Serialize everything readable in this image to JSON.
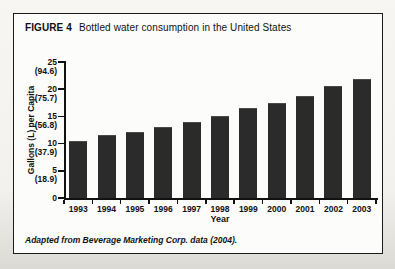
{
  "figure": {
    "label": "FIGURE 4",
    "title": "Bottled water consumption in the United States",
    "footnote": "Adapted from Beverage Marketing Corp. data (2004)."
  },
  "chart_data": {
    "type": "bar",
    "title": "Bottled water consumption in the United States",
    "categories": [
      "1993",
      "1994",
      "1995",
      "1996",
      "1997",
      "1998",
      "1999",
      "2000",
      "2001",
      "2002",
      "2003"
    ],
    "values": [
      10.4,
      11.5,
      12.1,
      13.1,
      14.0,
      15.1,
      16.6,
      17.4,
      18.8,
      20.6,
      21.9
    ],
    "xlabel": "Year",
    "ylabel": "Gallons (L) per Capita",
    "ylim": [
      0,
      25
    ],
    "yticks": [
      {
        "value": 25,
        "label": "25",
        "sub": "(94.6)"
      },
      {
        "value": 20,
        "label": "20",
        "sub": "(75.7)"
      },
      {
        "value": 15,
        "label": "15",
        "sub": "(56.8)"
      },
      {
        "value": 10,
        "label": "10",
        "sub": "(37.9)"
      },
      {
        "value": 5,
        "label": "5",
        "sub": "(18.9)"
      },
      {
        "value": 0,
        "label": "0",
        "sub": ""
      }
    ],
    "grid": false,
    "legend": false,
    "bar_color": "#2b2b2b",
    "axis_color": "#111111"
  }
}
